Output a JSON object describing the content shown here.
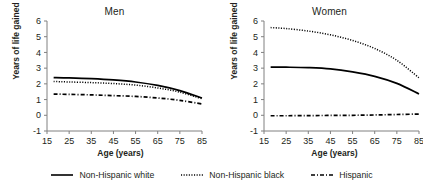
{
  "figure": {
    "background": "#ffffff",
    "line_color": "#000000",
    "axis_color": "#808080"
  },
  "legend": {
    "position": "bottom-center",
    "items": [
      {
        "label": "Non-Hispanic white",
        "style": "solid",
        "swatch": "solid-line-swatch"
      },
      {
        "label": "Non-Hispanic black",
        "style": "dotted",
        "swatch": "dotted-line-swatch"
      },
      {
        "label": "Hispanic",
        "style": "dash-dot",
        "swatch": "dash-dot-line-swatch"
      }
    ]
  },
  "chart_data": [
    {
      "type": "line",
      "title": "Men",
      "xlabel": "Age (years)",
      "ylabel": "Years of life gained",
      "xlim": [
        15,
        85
      ],
      "ylim": [
        -1,
        6
      ],
      "xticks": [
        15,
        25,
        35,
        45,
        55,
        65,
        75,
        85
      ],
      "yticks": [
        -1,
        0,
        1,
        2,
        3,
        4,
        5,
        6
      ],
      "grid": false,
      "x": [
        18,
        25,
        35,
        45,
        55,
        65,
        75,
        85
      ],
      "series": [
        {
          "name": "Non-Hispanic white",
          "style": "solid",
          "values": [
            2.4,
            2.38,
            2.33,
            2.25,
            2.12,
            1.9,
            1.57,
            1.1
          ]
        },
        {
          "name": "Non-Hispanic black",
          "style": "dotted",
          "values": [
            2.15,
            2.12,
            2.08,
            2.02,
            1.92,
            1.74,
            1.47,
            1.05
          ]
        },
        {
          "name": "Hispanic",
          "style": "dash-dot",
          "values": [
            1.35,
            1.33,
            1.3,
            1.25,
            1.2,
            1.1,
            0.95,
            0.72
          ]
        }
      ]
    },
    {
      "type": "line",
      "title": "Women",
      "xlabel": "Age (years)",
      "ylabel": "Years of life gained",
      "xlim": [
        15,
        85
      ],
      "ylim": [
        -1,
        6
      ],
      "xticks": [
        15,
        25,
        35,
        45,
        55,
        65,
        75,
        85
      ],
      "yticks": [
        -1,
        0,
        1,
        2,
        3,
        4,
        5,
        6
      ],
      "grid": false,
      "x": [
        18,
        25,
        35,
        45,
        55,
        65,
        75,
        85
      ],
      "series": [
        {
          "name": "Non-Hispanic white",
          "style": "solid",
          "values": [
            3.07,
            3.06,
            3.03,
            2.95,
            2.76,
            2.48,
            2.03,
            1.36
          ]
        },
        {
          "name": "Non-Hispanic black",
          "style": "dotted",
          "values": [
            5.58,
            5.52,
            5.36,
            5.12,
            4.76,
            4.25,
            3.5,
            2.38
          ]
        },
        {
          "name": "Hispanic",
          "style": "dash-dot",
          "values": [
            -0.03,
            -0.03,
            -0.02,
            -0.01,
            0.0,
            0.02,
            0.05,
            0.08
          ]
        }
      ]
    }
  ]
}
